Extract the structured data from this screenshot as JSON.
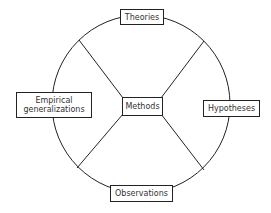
{
  "diagram": {
    "type": "wheel",
    "colors": {
      "stroke": "#222222",
      "text": "#333333",
      "background": "#ffffff"
    },
    "center_node": {
      "id": "methods",
      "label": "Methods"
    },
    "ring_nodes": [
      {
        "id": "theories",
        "label": "Theories",
        "position": "top"
      },
      {
        "id": "hypotheses",
        "label": "Hypotheses",
        "position": "right"
      },
      {
        "id": "observations",
        "label": "Observations",
        "position": "bottom"
      },
      {
        "id": "empirical-generalizations",
        "label_line1": "Empirical",
        "label_line2": "generalizations",
        "position": "left"
      }
    ],
    "connections": [
      {
        "from": "methods",
        "to": "ring",
        "direction": "upper-left"
      },
      {
        "from": "methods",
        "to": "ring",
        "direction": "upper-right"
      },
      {
        "from": "methods",
        "to": "ring",
        "direction": "lower-left"
      },
      {
        "from": "methods",
        "to": "ring",
        "direction": "lower-right"
      }
    ]
  }
}
